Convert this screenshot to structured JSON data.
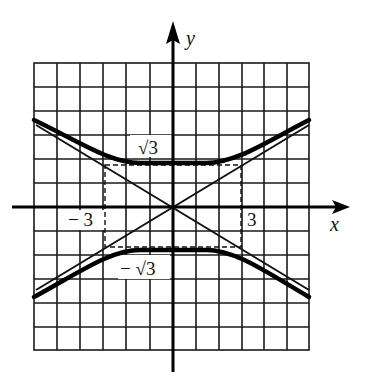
{
  "diagram": {
    "type": "hyperbola-graph",
    "equation_hint": "y^2/3 - x^2/9 = 1",
    "axes": {
      "x_label": "x",
      "y_label": "y"
    },
    "tick_labels": {
      "x_neg": "− 3",
      "x_pos": "3",
      "y_pos": "√3",
      "y_neg": "− √3"
    },
    "grid": {
      "columns": 12,
      "rows": 12
    },
    "elements": [
      "upper-branch",
      "lower-branch",
      "asymptote-positive",
      "asymptote-negative",
      "dashed-rectangle"
    ],
    "colors": {
      "ink": "#111111",
      "background": "#ffffff"
    }
  }
}
